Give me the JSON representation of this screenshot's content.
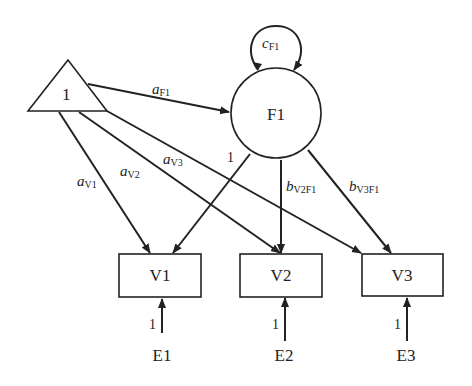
{
  "diagram": {
    "type": "path-diagram",
    "nodes": {
      "constant": {
        "label": "1",
        "shape": "triangle"
      },
      "F1": {
        "label": "F1",
        "shape": "circle"
      },
      "V1": {
        "label": "V1",
        "shape": "rectangle"
      },
      "V2": {
        "label": "V2",
        "shape": "rectangle"
      },
      "V3": {
        "label": "V3",
        "shape": "rectangle"
      },
      "E1": {
        "label": "E1"
      },
      "E2": {
        "label": "E2"
      },
      "E3": {
        "label": "E3"
      }
    },
    "edges": {
      "aF1": {
        "from": "1",
        "to": "F1",
        "main": "a",
        "sub": "F1"
      },
      "aV1": {
        "from": "1",
        "to": "V1",
        "main": "a",
        "sub": "V1"
      },
      "aV2": {
        "from": "1",
        "to": "V2",
        "main": "a",
        "sub": "V2"
      },
      "aV3": {
        "from": "1",
        "to": "V3",
        "main": "a",
        "sub": "V3"
      },
      "F1V1": {
        "from": "F1",
        "to": "V1",
        "label": "1"
      },
      "bV2F1": {
        "from": "F1",
        "to": "V2",
        "main": "b",
        "sub": "V2F1"
      },
      "bV3F1": {
        "from": "F1",
        "to": "V3",
        "main": "b",
        "sub": "V3F1"
      },
      "cF1": {
        "from": "F1",
        "to": "F1",
        "main": "c",
        "sub": "F1",
        "kind": "variance-loop"
      },
      "E1V1": {
        "from": "E1",
        "to": "V1",
        "label": "1"
      },
      "E2V2": {
        "from": "E2",
        "to": "V2",
        "label": "1"
      },
      "E3V3": {
        "from": "E3",
        "to": "V3",
        "label": "1"
      }
    }
  }
}
